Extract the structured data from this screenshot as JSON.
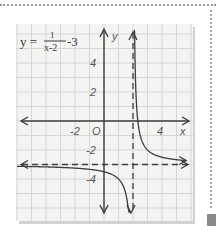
{
  "chart_data": {
    "type": "line",
    "equation": {
      "lhs": "y =",
      "numerator": "1",
      "denominator": "x-2",
      "tail": "-3"
    },
    "xlabel": "x",
    "ylabel": "y",
    "origin_label": "O",
    "xlim": [
      -6.2,
      5.8
    ],
    "ylim": [
      -7.0,
      6.7
    ],
    "x_ticks": [
      {
        "value": -2,
        "label": "-2"
      },
      {
        "value": 4,
        "label": "4"
      }
    ],
    "y_ticks": [
      {
        "value": 4,
        "label": "4"
      },
      {
        "value": 2,
        "label": "2"
      },
      {
        "value": -2,
        "label": "-2"
      },
      {
        "value": -4,
        "label": "-4"
      }
    ],
    "grid": true,
    "asymptotes": {
      "vertical": 2,
      "horizontal": -3
    },
    "function": "1/(x-2)-3",
    "branches": [
      {
        "name": "left-branch",
        "x_from": -6.0,
        "x_to": 1.86
      },
      {
        "name": "right-branch",
        "x_from": 2.08,
        "x_to": 5.6
      }
    ]
  },
  "colors": {
    "ink": "#3c3c3c",
    "grid": "#d6d6d6",
    "paper": "#f4f4f2"
  }
}
